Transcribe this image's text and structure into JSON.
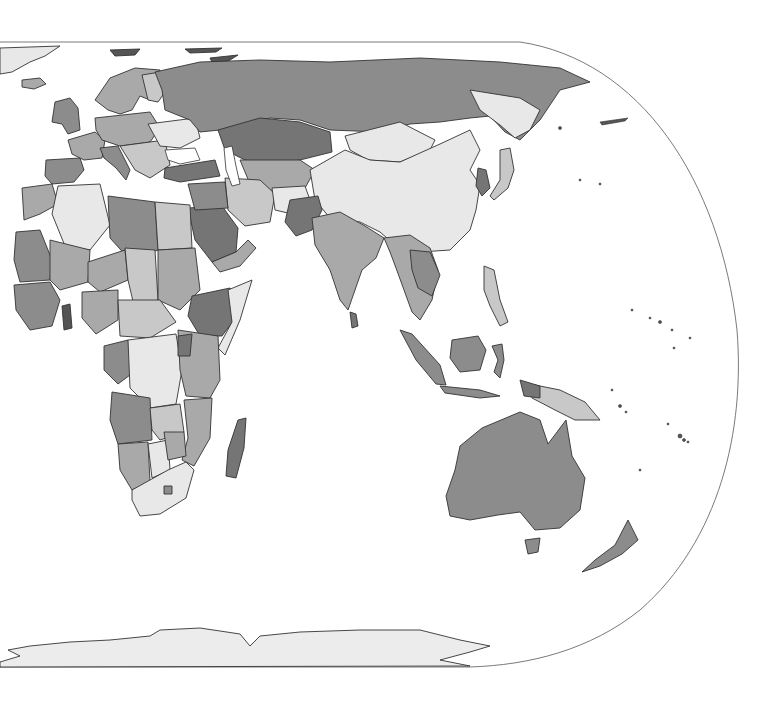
{
  "map": {
    "projection": "pseudo-cylindrical, eastern hemisphere",
    "labels": [],
    "shades": {
      "ocean": "#ffffff",
      "outline": "#333333",
      "frame": "#7a7a7a",
      "s1": "#e8e8e8",
      "s2": "#c8c8c8",
      "s3": "#a9a9a9",
      "s4": "#8c8c8c",
      "s5": "#757575",
      "antarctica": "#ececec"
    },
    "regions": [
      {
        "name": "greenland",
        "shade": "s1"
      },
      {
        "name": "iceland",
        "shade": "s3"
      },
      {
        "name": "scandinavia",
        "shade": "s3"
      },
      {
        "name": "western-europe",
        "shade": "s2"
      },
      {
        "name": "eastern-europe",
        "shade": "s3"
      },
      {
        "name": "russia",
        "shade": "s4"
      },
      {
        "name": "kazakhstan",
        "shade": "s5"
      },
      {
        "name": "mongolia",
        "shade": "s1"
      },
      {
        "name": "china",
        "shade": "s1"
      },
      {
        "name": "japan",
        "shade": "s2"
      },
      {
        "name": "korea",
        "shade": "s5"
      },
      {
        "name": "middle-east",
        "shade": "s2"
      },
      {
        "name": "turkey",
        "shade": "s5"
      },
      {
        "name": "saudi-arabia",
        "shade": "s5"
      },
      {
        "name": "iran",
        "shade": "s2"
      },
      {
        "name": "afghanistan",
        "shade": "s1"
      },
      {
        "name": "pakistan",
        "shade": "s5"
      },
      {
        "name": "india",
        "shade": "s3"
      },
      {
        "name": "southeast-asia",
        "shade": "s3"
      },
      {
        "name": "indonesia",
        "shade": "s4"
      },
      {
        "name": "new-guinea",
        "shade": "s2"
      },
      {
        "name": "australia",
        "shade": "s4"
      },
      {
        "name": "new-zealand",
        "shade": "s4"
      },
      {
        "name": "north-africa",
        "shade": "s2"
      },
      {
        "name": "libya",
        "shade": "s4"
      },
      {
        "name": "algeria",
        "shade": "s1"
      },
      {
        "name": "west-africa",
        "shade": "s3"
      },
      {
        "name": "central-africa",
        "shade": "s3"
      },
      {
        "name": "drc",
        "shade": "s1"
      },
      {
        "name": "ethiopia",
        "shade": "s5"
      },
      {
        "name": "east-africa",
        "shade": "s3"
      },
      {
        "name": "southern-africa",
        "shade": "s2"
      },
      {
        "name": "south-africa",
        "shade": "s1"
      },
      {
        "name": "madagascar",
        "shade": "s5"
      },
      {
        "name": "sri-lanka",
        "shade": "s5"
      },
      {
        "name": "antarctica",
        "shade": "antarctica"
      }
    ]
  }
}
